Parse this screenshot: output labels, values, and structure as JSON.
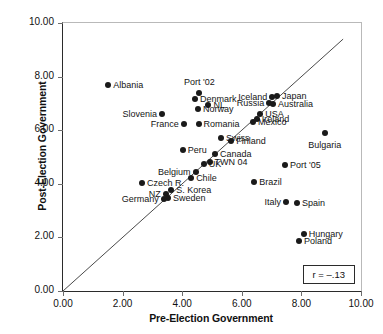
{
  "chart_data": {
    "type": "scatter",
    "title": "",
    "xlabel": "Pre-Election Government",
    "ylabel": "Post-Election Government",
    "xlim": [
      0,
      10
    ],
    "ylim": [
      0,
      10
    ],
    "xticks": [
      "0.00",
      "2.00",
      "4.00",
      "6.00",
      "8.00",
      "10.00"
    ],
    "yticks": [
      "0.00",
      "2.00",
      "4.00",
      "6.00",
      "8.00",
      "10.00"
    ],
    "xtick_values": [
      0,
      2,
      4,
      6,
      8,
      10
    ],
    "ytick_values": [
      0,
      2,
      4,
      6,
      8,
      10
    ],
    "grid": false,
    "legend": "none",
    "annotations": [
      {
        "name": "correlation-box",
        "text": "r = –.13",
        "position": "bottom-right"
      }
    ],
    "reference_line": {
      "name": "diagonal-identity-line",
      "description": "45-degree line y = x",
      "from": [
        0,
        0
      ],
      "to": [
        9.4,
        9.4
      ]
    },
    "points": [
      {
        "label": "Albania",
        "x": 1.52,
        "y": 7.68,
        "label_pos": "r"
      },
      {
        "label": "Slovenia",
        "x": 3.32,
        "y": 6.62,
        "label_pos": "l"
      },
      {
        "label": "France",
        "x": 4.05,
        "y": 6.23,
        "label_pos": "l"
      },
      {
        "label": "Port '02",
        "x": 4.58,
        "y": 7.4,
        "label_pos": "top"
      },
      {
        "label": "Denmark",
        "x": 4.43,
        "y": 7.17,
        "label_pos": "r"
      },
      {
        "label": "NL",
        "x": 4.88,
        "y": 6.93,
        "label_pos": "r"
      },
      {
        "label": "Norway",
        "x": 4.53,
        "y": 6.78,
        "label_pos": "r"
      },
      {
        "label": "Romania",
        "x": 4.55,
        "y": 6.24,
        "label_pos": "r"
      },
      {
        "label": "Iceland",
        "x": 7.02,
        "y": 7.25,
        "label_pos": "l"
      },
      {
        "label": "Japan",
        "x": 7.18,
        "y": 7.28,
        "label_pos": "r"
      },
      {
        "label": "Russia",
        "x": 6.92,
        "y": 7.0,
        "label_pos": "l"
      },
      {
        "label": "Australia",
        "x": 7.05,
        "y": 6.98,
        "label_pos": "r"
      },
      {
        "label": "USA",
        "x": 6.62,
        "y": 6.62,
        "label_pos": "r"
      },
      {
        "label": "Ireland",
        "x": 6.5,
        "y": 6.4,
        "label_pos": "r"
      },
      {
        "label": "Mexico",
        "x": 6.38,
        "y": 6.3,
        "label_pos": "r"
      },
      {
        "label": "Swiss",
        "x": 5.3,
        "y": 5.72,
        "label_pos": "r"
      },
      {
        "label": "Finland",
        "x": 5.65,
        "y": 5.58,
        "label_pos": "r"
      },
      {
        "label": "Peru",
        "x": 4.02,
        "y": 5.27,
        "label_pos": "r"
      },
      {
        "label": "Canada",
        "x": 5.1,
        "y": 5.12,
        "label_pos": "r"
      },
      {
        "label": "TWN 04",
        "x": 4.92,
        "y": 4.8,
        "label_pos": "r"
      },
      {
        "label": "UK",
        "x": 4.72,
        "y": 4.73,
        "label_pos": "r"
      },
      {
        "label": "Belgium",
        "x": 4.45,
        "y": 4.45,
        "label_pos": "l"
      },
      {
        "label": "Chile",
        "x": 4.3,
        "y": 4.23,
        "label_pos": "r"
      },
      {
        "label": "Czech R.",
        "x": 2.65,
        "y": 4.03,
        "label_pos": "r"
      },
      {
        "label": "S. Korea",
        "x": 3.63,
        "y": 3.78,
        "label_pos": "r"
      },
      {
        "label": "NZ",
        "x": 3.45,
        "y": 3.62,
        "label_pos": "l"
      },
      {
        "label": "Sweden",
        "x": 3.52,
        "y": 3.48,
        "label_pos": "r"
      },
      {
        "label": "Germany",
        "x": 3.38,
        "y": 3.42,
        "label_pos": "l"
      },
      {
        "label": "Bulgaria",
        "x": 8.78,
        "y": 5.9,
        "label_pos": "bottom"
      },
      {
        "label": "Port '05",
        "x": 7.45,
        "y": 4.7,
        "label_pos": "r"
      },
      {
        "label": "Brazil",
        "x": 6.42,
        "y": 4.05,
        "label_pos": "r"
      },
      {
        "label": "Italy",
        "x": 7.48,
        "y": 3.33,
        "label_pos": "l"
      },
      {
        "label": "Spain",
        "x": 7.85,
        "y": 3.3,
        "label_pos": "r"
      },
      {
        "label": "Hungary",
        "x": 8.08,
        "y": 2.13,
        "label_pos": "r"
      },
      {
        "label": "Poland",
        "x": 7.92,
        "y": 1.87,
        "label_pos": "r"
      }
    ]
  }
}
